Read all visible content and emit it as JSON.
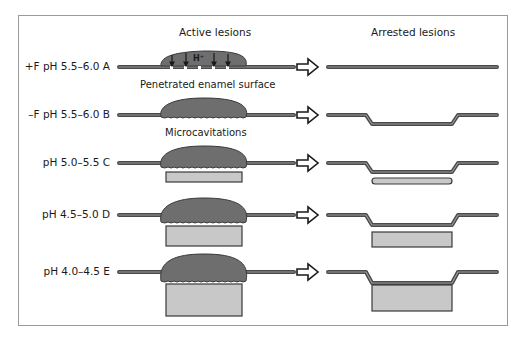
{
  "figure": {
    "headings": {
      "left": "Active lesions",
      "right": "Arrested lesions"
    },
    "rows": [
      {
        "id": "A",
        "label": "+F pH 5.5–6.0  A",
        "caption": "Penetrated enamel surface",
        "ion_label": "H⁺",
        "subsurface_depth": 0,
        "arrested_depth": 0
      },
      {
        "id": "B",
        "label": "–F pH 5.5–6.0  B",
        "caption": "Microcavitations",
        "subsurface_depth": 0,
        "arrested_depth": 1
      },
      {
        "id": "C",
        "label": "pH 5.0–5.5  C",
        "subsurface_depth": 1,
        "arrested_depth": 1
      },
      {
        "id": "D",
        "label": "pH 4.5–5.0  D",
        "subsurface_depth": 2,
        "arrested_depth": 2
      },
      {
        "id": "E",
        "label": "pH 4.0–4.5  E",
        "subsurface_depth": 3,
        "arrested_depth": 3
      }
    ],
    "colors": {
      "line": "#5a5a5a",
      "line_highlight": "#9a9a9a",
      "lesion_fill": "#6e6e6e",
      "subsurface_fill": "#c8c8c8",
      "frame": "#9a9a9a",
      "text": "#1a1a1a"
    },
    "icons": {
      "transition": "outline-right-arrow-icon"
    }
  }
}
